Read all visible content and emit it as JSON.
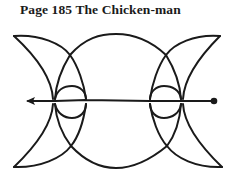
{
  "page": {
    "title": "Page 185 The Chicken-man"
  },
  "figure": {
    "name": "chicken-man-line-drawing",
    "stroke_color": "#1a1a1a",
    "background": "#ffffff",
    "elements": [
      "left-crescent",
      "right-crescent",
      "central-circle",
      "inner-small-circle",
      "horizontal-line",
      "left-arrowhead",
      "right-endpoint-dot"
    ]
  }
}
